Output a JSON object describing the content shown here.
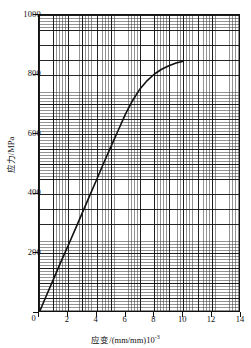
{
  "chart_data": {
    "type": "line",
    "title": "",
    "xlabel": "应变/(mm/mm)10",
    "xlabel_exponent": "-3",
    "ylabel": "应力/MPa",
    "xlim": [
      0,
      14
    ],
    "ylim": [
      0,
      1000
    ],
    "xticks": [
      0,
      2,
      4,
      6,
      8,
      10,
      12,
      14
    ],
    "yticks": [
      0,
      200,
      400,
      600,
      800,
      1000
    ],
    "xtick_labels": [
      "0",
      "2",
      "4",
      "6",
      "8",
      "10",
      "12",
      "14"
    ],
    "ytick_labels": [
      "0",
      "200",
      "400",
      "600",
      "800",
      "1000"
    ],
    "grid": "graph-paper fine grid with major lines",
    "legend": "none",
    "series": [
      {
        "name": "stress-strain curve",
        "color": "#111111",
        "x": [
          0.0,
          0.5,
          1.0,
          1.5,
          2.0,
          2.5,
          3.0,
          3.5,
          4.0,
          4.5,
          5.0,
          5.5,
          6.0,
          6.5,
          7.0,
          7.5,
          8.0,
          8.5,
          9.0,
          9.5,
          10.0
        ],
        "y": [
          0,
          57,
          113,
          170,
          224,
          280,
          336,
          392,
          448,
          505,
          560,
          614,
          668,
          714,
          752,
          780,
          802,
          818,
          830,
          839,
          845
        ]
      }
    ],
    "annotations": []
  },
  "axes": {
    "y_labels": [
      {
        "value": 1000,
        "text": "1000"
      },
      {
        "value": 800,
        "text": "800"
      },
      {
        "value": 600,
        "text": "600"
      },
      {
        "value": 400,
        "text": "400"
      },
      {
        "value": 200,
        "text": "200"
      },
      {
        "value": 0,
        "text": "0"
      }
    ],
    "x_labels": [
      {
        "value": 0,
        "text": "0"
      },
      {
        "value": 2,
        "text": "2"
      },
      {
        "value": 4,
        "text": "4"
      },
      {
        "value": 6,
        "text": "6"
      },
      {
        "value": 8,
        "text": "8"
      },
      {
        "value": 10,
        "text": "10"
      },
      {
        "value": 12,
        "text": "12"
      },
      {
        "value": 14,
        "text": "14"
      }
    ],
    "y_title": "应力/MPa",
    "x_title_base": "应变/(mm/mm)10",
    "x_title_sup": "-3"
  },
  "colors": {
    "curve": "#111111",
    "axis": "#111111",
    "grid_fine": "#3c3c3c",
    "grid_major": "#141414",
    "background": "#ffffff"
  }
}
